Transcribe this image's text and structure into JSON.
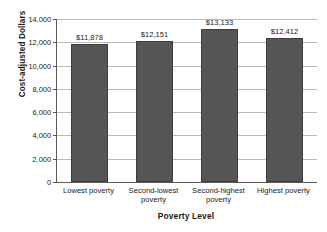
{
  "chart_data": {
    "type": "bar",
    "title": "",
    "xlabel": "Poverty Level",
    "ylabel": "Cost-adjusted Dollars",
    "categories": [
      "Lowest poverty",
      "Second-lowest poverty",
      "Second-highest poverty",
      "Highest poverty"
    ],
    "values": [
      11878,
      12151,
      13133,
      12412
    ],
    "value_labels": [
      "$11,878",
      "$12,151",
      "$13,133",
      "$12,412"
    ],
    "ylim": [
      0,
      14000
    ],
    "ytick_values": [
      0,
      2000,
      4000,
      6000,
      8000,
      10000,
      12000,
      14000
    ],
    "ytick_labels": [
      "0",
      "2,000",
      "4,000",
      "6,000",
      "8,000",
      "10,000",
      "12,000",
      "14,000"
    ],
    "grid": true,
    "legend": false,
    "legend_position": "none",
    "bar_color": "#555555",
    "bar_edge_color": "#3d3d3d",
    "grid_color": "#b9b9b9",
    "axis_color": "#5a5a5a",
    "background_color": "#ffffff"
  }
}
